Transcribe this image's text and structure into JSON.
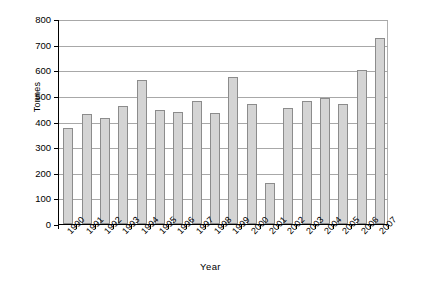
{
  "chart_data": {
    "type": "bar",
    "title": "",
    "xlabel": "Year",
    "ylabel": "Tonnes",
    "ylim": [
      0,
      800
    ],
    "ytick_step": 100,
    "yticks": [
      "800",
      "700",
      "600",
      "500",
      "400",
      "300",
      "200",
      "100",
      "0"
    ],
    "grid": true,
    "legend": "none",
    "categories": [
      "1990",
      "1991",
      "1992",
      "1993",
      "1994",
      "1995",
      "1996",
      "1997",
      "1998",
      "1999",
      "2000",
      "2001",
      "2002",
      "2003",
      "2004",
      "2005",
      "2006",
      "2007"
    ],
    "values": [
      375,
      428,
      413,
      461,
      563,
      446,
      437,
      481,
      432,
      575,
      468,
      160,
      452,
      480,
      492,
      470,
      600,
      725
    ],
    "bar_fill": "#d4d4d4",
    "bar_border": "#8c8c8c",
    "gridline_color": "#a8a8a8",
    "axis_color": "#000000",
    "background": "#ffffff"
  }
}
